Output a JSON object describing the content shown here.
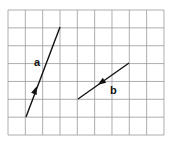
{
  "grid": {
    "x0": 8,
    "y0": 10,
    "cols": 9,
    "rows": 7,
    "cell_w": 17.33,
    "cell_h": 17.86,
    "line_color": "#999999"
  },
  "vectors": [
    {
      "label": "a",
      "from": [
        26,
        117
      ],
      "to": [
        60,
        27
      ],
      "arrow_at": [
        35,
        93
      ],
      "label_pos": [
        34,
        66
      ]
    },
    {
      "label": "b",
      "from": [
        78,
        99
      ],
      "to": [
        129,
        63
      ],
      "arrow_at": [
        102,
        82
      ],
      "label_pos": [
        110,
        94
      ]
    }
  ]
}
